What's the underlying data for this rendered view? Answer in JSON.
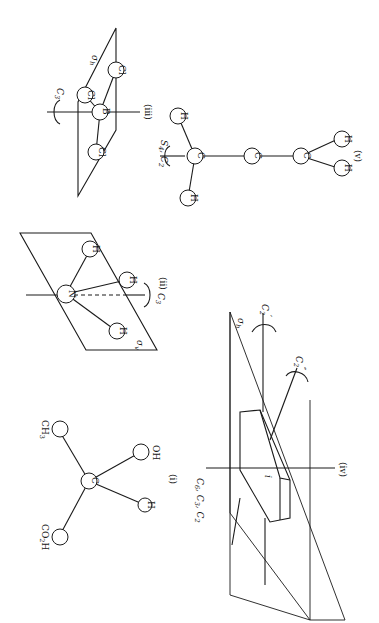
{
  "figure": {
    "orientation": "rotated 90 degrees (page printed sideways)",
    "panels": [
      {
        "id": "i",
        "label": "(i)",
        "central_atom": "C",
        "substituents": [
          "CH3",
          "OH",
          "H",
          "CO2H"
        ],
        "substituent_labels": {
          "ch3": "CH",
          "ch3_sub": "3",
          "oh": "OH",
          "h": "H",
          "co2h_a": "CO",
          "co2h_sub": "2",
          "co2h_b": "H",
          "c": "C"
        }
      },
      {
        "id": "ii",
        "label": "(ii)",
        "central_atom": "N",
        "atoms": [
          "H",
          "H",
          "H"
        ],
        "plane_label": "σ",
        "plane_sub": "v",
        "axis_label": "C",
        "axis_sub": "3"
      },
      {
        "id": "iii",
        "label": "(iii)",
        "central_atom": "B",
        "atoms": [
          "Cl",
          "Cl",
          "Cl"
        ],
        "plane_label": "σ",
        "plane_sub": "h",
        "axis_label": "C",
        "axis_sub": "3"
      },
      {
        "id": "iv",
        "label": "(iv)",
        "inversion_label": "i",
        "plane_label": "σ",
        "plane_sub": "h",
        "main_axis_label": "C",
        "main_axis_text": "6, C",
        "main_axis_parts": [
          "C",
          "6",
          ", C",
          "3",
          ", C",
          "2"
        ],
        "c2_prime_label": "C",
        "c2_prime_sub": "2",
        "c2_prime_sup": "′",
        "c2_dprime_label": "C",
        "c2_dprime_sub": "2",
        "c2_dprime_sup": "″"
      },
      {
        "id": "v",
        "label": "(v)",
        "chain": [
          "C",
          "C",
          "C"
        ],
        "terminal_h": [
          "H",
          "H",
          "H",
          "H"
        ],
        "axis_label_a": "S",
        "axis_sub_a": "4",
        "axis_label_b": ", C",
        "axis_sub_b": "2"
      }
    ]
  }
}
